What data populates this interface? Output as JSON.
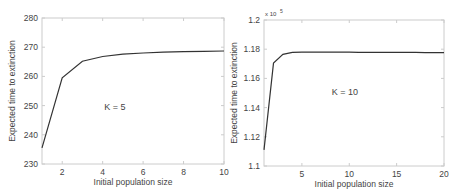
{
  "chart_data": [
    {
      "type": "line",
      "title": "",
      "annotation": "K = 5",
      "xlabel": "Initial population size",
      "ylabel": "Expected time to extinction",
      "xlim": [
        1,
        10
      ],
      "ylim": [
        230,
        280
      ],
      "xticks": [
        2,
        4,
        6,
        8,
        10
      ],
      "yticks": [
        230,
        240,
        250,
        260,
        270,
        280
      ],
      "y_multiplier": "",
      "grid": false,
      "x": [
        1,
        2,
        3,
        4,
        5,
        6,
        7,
        8,
        9,
        10
      ],
      "series": [
        {
          "name": "K = 5",
          "values": [
            235.5,
            259.5,
            265.2,
            266.8,
            267.6,
            268.0,
            268.3,
            268.5,
            268.6,
            268.7
          ]
        }
      ]
    },
    {
      "type": "line",
      "title": "",
      "annotation": "K = 10",
      "xlabel": "Initial population size",
      "ylabel": "Expected time to extinction",
      "xlim": [
        1,
        20
      ],
      "ylim": [
        1.1,
        1.2
      ],
      "xticks": [
        5,
        10,
        15,
        20
      ],
      "yticks": [
        1.1,
        1.12,
        1.14,
        1.16,
        1.18,
        1.2
      ],
      "y_multiplier": "x 10^5",
      "grid": false,
      "x": [
        1,
        2,
        3,
        4,
        5,
        6,
        7,
        8,
        9,
        10,
        11,
        12,
        13,
        14,
        15,
        16,
        17,
        18,
        19,
        20
      ],
      "series": [
        {
          "name": "K = 10",
          "values": [
            1.111,
            1.1705,
            1.1765,
            1.1778,
            1.178,
            1.178,
            1.178,
            1.178,
            1.178,
            1.178,
            1.1779,
            1.1779,
            1.1779,
            1.1778,
            1.1778,
            1.1778,
            1.1778,
            1.1777,
            1.1777,
            1.1777
          ]
        }
      ]
    }
  ],
  "labels": {
    "left_annotation": "K = 5",
    "right_annotation": "K = 10",
    "xlabel": "Initial population size",
    "ylabel": "Expected time to extinction",
    "right_exponent_base": "x 10",
    "right_exponent_power": "5"
  },
  "colors": {
    "line": "#333333",
    "axis": "#cccccc",
    "text": "#444444"
  }
}
